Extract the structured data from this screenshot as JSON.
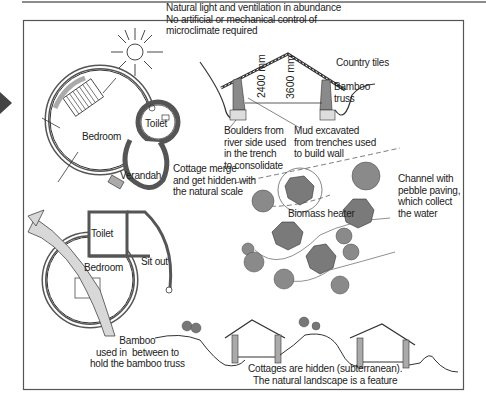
{
  "figure": {
    "type": "architectural-diagram",
    "frame_color": "#555555",
    "ink_color": "#222222",
    "fill_gray": "#8a8a8a",
    "light_gray": "#d4d4d4"
  },
  "annotations": {
    "natural_light": "Natural light and ventilation in abundance\nNo artificial or mechanical control of\nmicroclimate required",
    "country_tiles": "Country tiles",
    "bamboo_truss": "Bamboo\ntruss",
    "dim_2400": "2400 mm",
    "dim_3600": "3600 mm",
    "boulders": "Boulders from\nriver side used\nin the trench\nto consolidate",
    "mud": "Mud excavated\nfrom trenches used\nto build wall",
    "cottage_merge": "Cottage merge\nand get hidden with\nthe natural scale",
    "channel": "Channel with\npebble paving,\nwhich collect\nthe water",
    "biomass": "Biomass heater",
    "bamboo_between": "Bamboo\nused in  between to\nhold the bamboo truss",
    "cottages_hidden": "Cottages are hidden (subterranean).\nThe natural landscape is a feature"
  },
  "plan_top": {
    "rooms": [
      "Bedroom",
      "Toilet",
      "Verandah"
    ]
  },
  "plan_bottom": {
    "rooms": [
      "Toilet",
      "Bedroom",
      "Sit out"
    ]
  }
}
